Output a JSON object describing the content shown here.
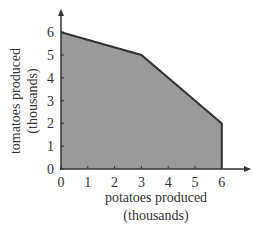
{
  "chart_data": {
    "type": "area",
    "title": "",
    "xlabel": "potatoes produced (thousands)",
    "ylabel": "tomatoes produced (thousands)",
    "xlabel_lines": [
      "potatoes produced",
      "(thousands)"
    ],
    "ylabel_lines": [
      "tomatoes produced",
      "(thousands)"
    ],
    "x_ticks": [
      "0",
      "1",
      "2",
      "3",
      "4",
      "5",
      "6"
    ],
    "y_ticks": [
      "0",
      "1",
      "2",
      "3",
      "4",
      "5",
      "6"
    ],
    "xlim": [
      0,
      6
    ],
    "ylim": [
      0,
      6
    ],
    "grid": false,
    "legend": null,
    "series": [
      {
        "name": "feasible production region",
        "points": [
          [
            0,
            6
          ],
          [
            3,
            5
          ],
          [
            6,
            2
          ],
          [
            6,
            0
          ],
          [
            0,
            0
          ]
        ]
      }
    ],
    "boundary": [
      [
        0,
        6
      ],
      [
        3,
        5
      ],
      [
        6,
        2
      ]
    ],
    "fill_color": "#9a9a9a",
    "line_color": "#333333"
  }
}
